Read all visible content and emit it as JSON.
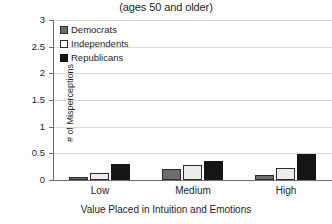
{
  "chart_data": {
    "type": "bar",
    "title": "(ages 50 and older)",
    "xlabel": "Value Placed in Intuition and Emotions",
    "ylabel": "# of Misperceptions",
    "categories": [
      "Low",
      "Medium",
      "High"
    ],
    "ylim": [
      0,
      3
    ],
    "yticks": [
      "0",
      "0.5",
      "1",
      "1.5",
      "2",
      "2.5",
      "3"
    ],
    "ytick_values": [
      0,
      0.5,
      1,
      1.5,
      2,
      2.5,
      3
    ],
    "grid": true,
    "legend_position": "top-left-inside",
    "series": [
      {
        "name": "Democrats",
        "color": "#6d6d6d",
        "values": [
          0.05,
          0.21,
          0.09
        ]
      },
      {
        "name": "Independents",
        "color": "#ededed",
        "values": [
          0.14,
          0.29,
          0.23
        ]
      },
      {
        "name": "Republicans",
        "color": "#151515",
        "values": [
          0.3,
          0.36,
          0.48
        ]
      }
    ]
  }
}
